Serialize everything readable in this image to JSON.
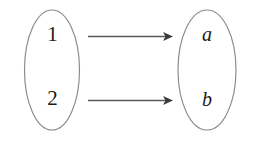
{
  "diagram": {
    "type": "function-mapping-diagram",
    "background_color": "#ffffff",
    "stroke_color": "#8a8a8a",
    "arrow_color": "#5a5a5a",
    "arrowhead_color": "#3a3a3a",
    "text_color": "#1a1a1a",
    "domain_set": {
      "name": "domain-set",
      "elements": [
        {
          "label": "1",
          "style": "roman"
        },
        {
          "label": "2",
          "style": "roman"
        }
      ]
    },
    "codomain_set": {
      "name": "codomain-set",
      "elements": [
        {
          "label": "a",
          "style": "italic"
        },
        {
          "label": "b",
          "style": "italic"
        }
      ]
    },
    "mappings": [
      {
        "from": "1",
        "to": "a"
      },
      {
        "from": "2",
        "to": "b"
      }
    ]
  }
}
